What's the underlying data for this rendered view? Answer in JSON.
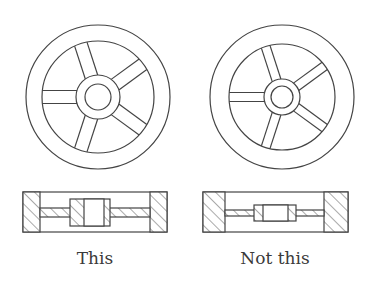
{
  "figure": {
    "left": {
      "caption": "This",
      "wheel": {
        "cx": 98,
        "cy": 97,
        "outer_r": 72,
        "rim_r": 56,
        "hub_r": 22,
        "bore_r": 13,
        "spokes": 5,
        "spoke_width": 13
      },
      "section": {
        "x": 23,
        "y": 192,
        "w": 144,
        "h": 40
      }
    },
    "right": {
      "caption": "Not this",
      "wheel": {
        "cx": 282,
        "cy": 97,
        "outer_r": 72,
        "rim_r": 53,
        "hub_r": 18,
        "bore_r": 11,
        "spokes": 5,
        "spoke_width": 9
      },
      "section": {
        "x": 203,
        "y": 192,
        "w": 145,
        "h": 40
      }
    },
    "colors": {
      "line": "#444444",
      "background": "#ffffff"
    }
  }
}
